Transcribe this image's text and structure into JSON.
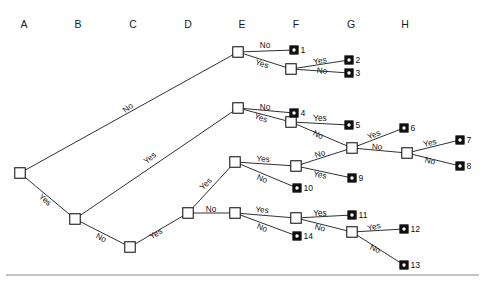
{
  "figure": {
    "type": "decision-tree",
    "background": "#ffffff",
    "line_color": "#1a1a1a",
    "decision_node_fill": "#ffffff",
    "terminal_node_fill": "#111111",
    "rule_color": "#888888"
  },
  "columns": [
    {
      "label": "A",
      "x": 24
    },
    {
      "label": "B",
      "x": 78
    },
    {
      "label": "C",
      "x": 133
    },
    {
      "label": "D",
      "x": 188
    },
    {
      "label": "E",
      "x": 242
    },
    {
      "label": "F",
      "x": 296
    },
    {
      "label": "G",
      "x": 351
    },
    {
      "label": "H",
      "x": 405
    }
  ],
  "column_header_y": 24,
  "decision_nodes": [
    {
      "id": "a1",
      "column": "A",
      "x": 20,
      "y": 173
    },
    {
      "id": "b1",
      "column": "B",
      "x": 75,
      "y": 219
    },
    {
      "id": "c1",
      "column": "C",
      "x": 130,
      "y": 247
    },
    {
      "id": "d1",
      "column": "D",
      "x": 188,
      "y": 213
    },
    {
      "id": "e1",
      "column": "E",
      "x": 238,
      "y": 52
    },
    {
      "id": "e2",
      "column": "E",
      "x": 238,
      "y": 108
    },
    {
      "id": "e3",
      "column": "E",
      "x": 235,
      "y": 162
    },
    {
      "id": "e4",
      "column": "E",
      "x": 235,
      "y": 213
    },
    {
      "id": "f1",
      "column": "F",
      "x": 291,
      "y": 69
    },
    {
      "id": "f2",
      "column": "F",
      "x": 291,
      "y": 122
    },
    {
      "id": "f3",
      "column": "F",
      "x": 296,
      "y": 166
    },
    {
      "id": "f4",
      "column": "F",
      "x": 296,
      "y": 218
    },
    {
      "id": "g1",
      "column": "G",
      "x": 352,
      "y": 148
    },
    {
      "id": "g2",
      "column": "G",
      "x": 352,
      "y": 232
    },
    {
      "id": "h1",
      "column": "H",
      "x": 407,
      "y": 153
    }
  ],
  "terminal_nodes": [
    {
      "label": "1",
      "x": 294,
      "y": 50
    },
    {
      "label": "2",
      "x": 349,
      "y": 60
    },
    {
      "label": "3",
      "x": 349,
      "y": 73
    },
    {
      "label": "4",
      "x": 294,
      "y": 113
    },
    {
      "label": "5",
      "x": 349,
      "y": 125
    },
    {
      "label": "6",
      "x": 404,
      "y": 128
    },
    {
      "label": "7",
      "x": 460,
      "y": 140
    },
    {
      "label": "8",
      "x": 460,
      "y": 166
    },
    {
      "label": "9",
      "x": 352,
      "y": 178
    },
    {
      "label": "10",
      "x": 297,
      "y": 188
    },
    {
      "label": "11",
      "x": 352,
      "y": 215
    },
    {
      "label": "12",
      "x": 404,
      "y": 229
    },
    {
      "label": "13",
      "x": 404,
      "y": 265
    },
    {
      "label": "14",
      "x": 297,
      "y": 236
    }
  ],
  "edges": [
    {
      "from": "a1",
      "to": "e1",
      "label": "No",
      "lx": 128,
      "ly": 108,
      "rot": -40
    },
    {
      "from": "a1",
      "to": "b1",
      "label": "Yes",
      "lx": 45,
      "ly": 200,
      "rot": 40
    },
    {
      "from": "b1",
      "to": "e2",
      "label": "Yes",
      "lx": 150,
      "ly": 158,
      "rot": -40
    },
    {
      "from": "b1",
      "to": "c1",
      "label": "No",
      "lx": 101,
      "ly": 238,
      "rot": 27
    },
    {
      "from": "c1",
      "to": "d1",
      "label": "Yes",
      "lx": 156,
      "ly": 234,
      "rot": -31
    },
    {
      "from": "d1",
      "to": "e3",
      "label": "Yes",
      "lx": 206,
      "ly": 184,
      "rot": -45
    },
    {
      "from": "d1",
      "to": "e4",
      "label": "No",
      "lx": 211,
      "ly": 209,
      "rot": 0
    },
    {
      "from": "e1",
      "to": "t1",
      "label": "No",
      "lx": 265,
      "ly": 45,
      "rot": 0
    },
    {
      "from": "e1",
      "to": "f1",
      "label": "Yes",
      "lx": 262,
      "ly": 64,
      "rot": 18
    },
    {
      "from": "f1",
      "to": "t2",
      "label": "Yes",
      "lx": 320,
      "ly": 61,
      "rot": -10
    },
    {
      "from": "f1",
      "to": "t3",
      "label": "No",
      "lx": 322,
      "ly": 71,
      "rot": 5
    },
    {
      "from": "e2",
      "to": "t4",
      "label": "No",
      "lx": 265,
      "ly": 107,
      "rot": 0
    },
    {
      "from": "e2",
      "to": "f2",
      "label": "Yes",
      "lx": 261,
      "ly": 118,
      "rot": 20
    },
    {
      "from": "f2",
      "to": "t5",
      "label": "Yes",
      "lx": 320,
      "ly": 118,
      "rot": 0
    },
    {
      "from": "f2",
      "to": "g1",
      "label": "No",
      "lx": 318,
      "ly": 135,
      "rot": 25
    },
    {
      "from": "g1",
      "to": "t6",
      "label": "Yes",
      "lx": 374,
      "ly": 135,
      "rot": -22
    },
    {
      "from": "g1",
      "to": "h1",
      "label": "No",
      "lx": 377,
      "ly": 147,
      "rot": 3
    },
    {
      "from": "h1",
      "to": "t7",
      "label": "Yes",
      "lx": 430,
      "ly": 143,
      "rot": -14
    },
    {
      "from": "h1",
      "to": "t8",
      "label": "No",
      "lx": 430,
      "ly": 161,
      "rot": 14
    },
    {
      "from": "e3",
      "to": "f3",
      "label": "Yes",
      "lx": 263,
      "ly": 159,
      "rot": 3
    },
    {
      "from": "e3",
      "to": "t10",
      "label": "No",
      "lx": 262,
      "ly": 179,
      "rot": 22
    },
    {
      "from": "f3",
      "to": "g1",
      "label": "No",
      "lx": 320,
      "ly": 154,
      "rot": -18
    },
    {
      "from": "f3",
      "to": "t9",
      "label": "Yes",
      "lx": 320,
      "ly": 175,
      "rot": 11
    },
    {
      "from": "e4",
      "to": "f4",
      "label": "Yes",
      "lx": 262,
      "ly": 210,
      "rot": 4
    },
    {
      "from": "e4",
      "to": "t14",
      "label": "No",
      "lx": 262,
      "ly": 228,
      "rot": 22
    },
    {
      "from": "f4",
      "to": "t11",
      "label": "Yes",
      "lx": 320,
      "ly": 213,
      "rot": 0
    },
    {
      "from": "f4",
      "to": "g2",
      "label": "No",
      "lx": 320,
      "ly": 228,
      "rot": 14
    },
    {
      "from": "g2",
      "to": "t12",
      "label": "Yes",
      "lx": 374,
      "ly": 227,
      "rot": -16
    },
    {
      "from": "g2",
      "to": "t13",
      "label": "No",
      "lx": 375,
      "ly": 249,
      "rot": 22
    }
  ],
  "footer_rule": {
    "y": 275,
    "x1": 6,
    "x2": 479
  }
}
